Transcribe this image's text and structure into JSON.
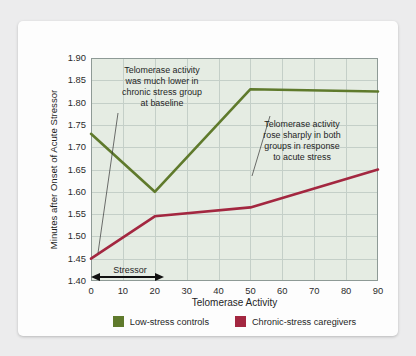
{
  "chart_data": {
    "type": "line",
    "title": "",
    "xlabel": "Telomerase Activity",
    "ylabel": "Minutes after Onset of Acute Stressor",
    "xlim": [
      0,
      90
    ],
    "ylim": [
      1.4,
      1.9
    ],
    "grid": true,
    "legend_position": "bottom",
    "xticks": [
      "0",
      "10",
      "20",
      "30",
      "40",
      "50",
      "60",
      "70",
      "80",
      "90"
    ],
    "yticks": [
      "1.40",
      "1.45",
      "1.50",
      "1.55",
      "1.60",
      "1.65",
      "1.70",
      "1.75",
      "1.80",
      "1.85",
      "1.90"
    ],
    "series": [
      {
        "name": "Low-stress controls",
        "color": "#5f7a2c",
        "x": [
          0,
          20,
          50,
          90
        ],
        "values": [
          1.73,
          1.6,
          1.83,
          1.825
        ]
      },
      {
        "name": "Chronic-stress caregivers",
        "color": "#a32740",
        "x": [
          0,
          20,
          50,
          90
        ],
        "values": [
          1.45,
          1.545,
          1.565,
          1.65
        ]
      }
    ],
    "annotations": [
      {
        "id": "baseline-note",
        "text": "Telomerase activity\nwas much lower in\nchronic stress group\nat baseline"
      },
      {
        "id": "acute-stress-note",
        "text": "Telomerase activity\nrose sharply in both\ngroups in response\nto acute stress"
      },
      {
        "id": "stressor-span",
        "text": "Stressor",
        "from_x": 0,
        "to_x": 20
      }
    ]
  },
  "legend": {
    "items": [
      {
        "label": "Low-stress controls",
        "color": "#5f7a2c"
      },
      {
        "label": "Chronic-stress caregivers",
        "color": "#a32740"
      }
    ]
  },
  "colors": {
    "plot_background": "#e5ece3",
    "gridline": "#c4cfc8",
    "axis": "#8e9a96",
    "card": "#fdfdfd",
    "page_background": "#ececed",
    "text": "#1f1f1f"
  }
}
